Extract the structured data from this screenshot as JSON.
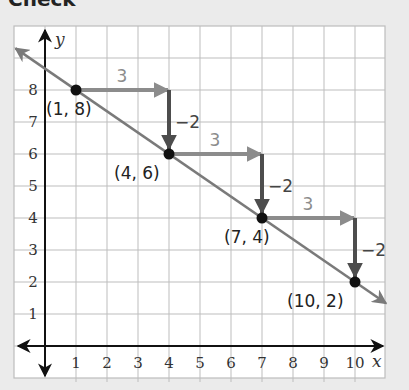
{
  "heading": "Check",
  "chart_data": {
    "type": "line",
    "title": "",
    "xlabel": "x",
    "ylabel": "y",
    "xlim": [
      0,
      11
    ],
    "ylim": [
      0,
      10
    ],
    "grid": true,
    "x_ticks": [
      "1",
      "2",
      "3",
      "4",
      "5",
      "6",
      "7",
      "8",
      "9",
      "10"
    ],
    "y_ticks": [
      "1",
      "2",
      "3",
      "4",
      "5",
      "6",
      "7",
      "8"
    ],
    "series": [
      {
        "name": "line",
        "points": [
          [
            1,
            8
          ],
          [
            4,
            6
          ],
          [
            7,
            4
          ],
          [
            10,
            2
          ]
        ],
        "slope": -0.6667,
        "point_labels": [
          "(1, 8)",
          "(4, 6)",
          "(7, 4)",
          "(10, 2)"
        ]
      }
    ],
    "annotations": [
      {
        "type": "run",
        "from": [
          1,
          8
        ],
        "to": [
          4,
          8
        ],
        "label": "3"
      },
      {
        "type": "rise",
        "from": [
          4,
          8
        ],
        "to": [
          4,
          6
        ],
        "label": "−2"
      },
      {
        "type": "run",
        "from": [
          4,
          6
        ],
        "to": [
          7,
          6
        ],
        "label": "3"
      },
      {
        "type": "rise",
        "from": [
          7,
          6
        ],
        "to": [
          7,
          4
        ],
        "label": "−2"
      },
      {
        "type": "run",
        "from": [
          7,
          4
        ],
        "to": [
          10,
          4
        ],
        "label": "3"
      },
      {
        "type": "rise",
        "from": [
          10,
          4
        ],
        "to": [
          10,
          2
        ],
        "label": "−2"
      }
    ],
    "colors": {
      "line": "#7a7a7a",
      "run_arrow": "#8c8c8c",
      "rise_arrow": "#4d4d4d",
      "points": "#111111",
      "grid": "#bdbdbd",
      "axes": "#111111"
    }
  }
}
